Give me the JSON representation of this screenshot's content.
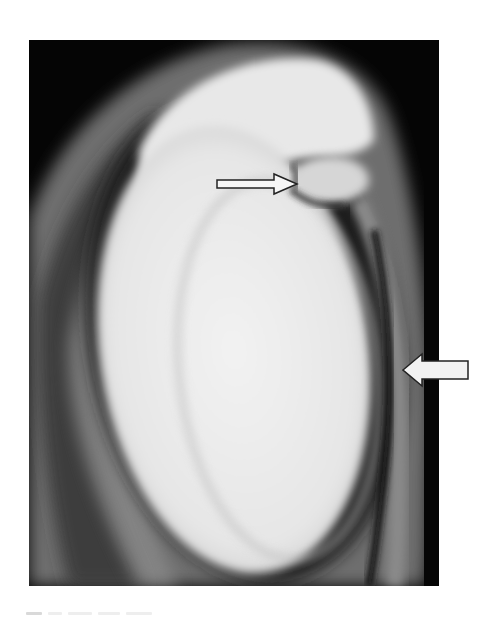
{
  "figure": {
    "kind": "grayscale MRI scan",
    "background_color": "#050505",
    "colors": {
      "outer_band": "#7a7a7a",
      "dark_gap": "#1a1a1a",
      "bright_region": "#f0f0f0",
      "arrow_fill": "#f4f4f4",
      "arrow_stroke": "#222222"
    }
  },
  "annotations": [
    {
      "name": "thin-right-arrow",
      "direction": "right"
    },
    {
      "name": "thick-left-arrow",
      "direction": "left"
    }
  ]
}
